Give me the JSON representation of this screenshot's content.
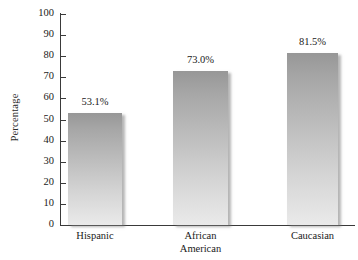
{
  "chart_data": {
    "type": "bar",
    "title": "",
    "xlabel": "",
    "ylabel": "Percentage",
    "ylim": [
      0,
      100
    ],
    "ytick_step": 10,
    "yticks": [
      "0",
      "10",
      "20",
      "30",
      "40",
      "50",
      "60",
      "70",
      "80",
      "90",
      "100"
    ],
    "grid": false,
    "legend": null,
    "categories": [
      "Hispanic",
      "African American",
      "Caucasian"
    ],
    "values": [
      53.1,
      73.0,
      81.5
    ],
    "value_labels": [
      "53.1%",
      "73.0%",
      "81.5%"
    ],
    "bar_fill_top_color": "#979797",
    "bar_fill_bottom_color": "#eaeaea",
    "axis_color": "#3a3a3a",
    "background_color": "#ffffff"
  },
  "axis": {
    "y_title": "Percentage"
  },
  "categories": [
    {
      "label": "Hispanic",
      "label_lines": "Hispanic"
    },
    {
      "label": "African American",
      "label_lines": "African\nAmerican"
    },
    {
      "label": "Caucasian",
      "label_lines": "Caucasian"
    }
  ]
}
